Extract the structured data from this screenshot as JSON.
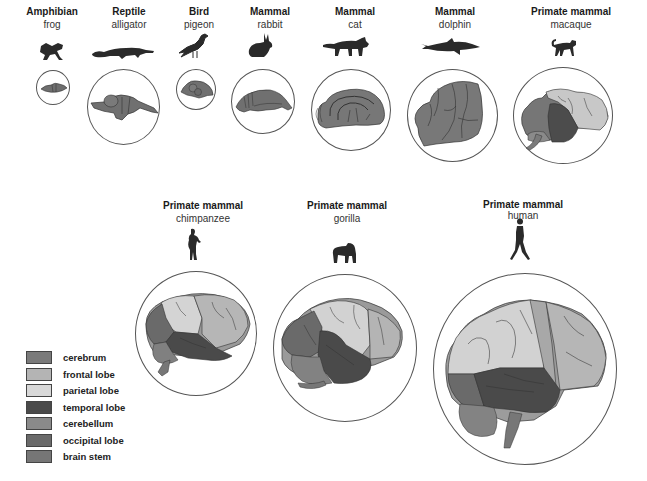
{
  "figure": {
    "animals": [
      {
        "class": "Amphibian",
        "species": "frog"
      },
      {
        "class": "Reptile",
        "species": "alligator"
      },
      {
        "class": "Bird",
        "species": "pigeon"
      },
      {
        "class": "Mammal",
        "species": "rabbit"
      },
      {
        "class": "Mammal",
        "species": "cat"
      },
      {
        "class": "Mammal",
        "species": "dolphin"
      },
      {
        "class": "Primate mammal",
        "species": "macaque"
      },
      {
        "class": "Primate mammal",
        "species": "chimpanzee"
      },
      {
        "class": "Primate mammal",
        "species": "gorilla"
      },
      {
        "class": "Primate mammal",
        "species": "human"
      }
    ]
  },
  "legend": {
    "items": [
      {
        "label": "cerebrum",
        "color": "#7a7a7a"
      },
      {
        "label": "frontal lobe",
        "color": "#b4b4b4"
      },
      {
        "label": "parietal lobe",
        "color": "#d8d8d8"
      },
      {
        "label": "temporal lobe",
        "color": "#4a4a4a"
      },
      {
        "label": "cerebellum",
        "color": "#8a8a8a"
      },
      {
        "label": "occipital lobe",
        "color": "#6a6a6a"
      },
      {
        "label": "brain stem",
        "color": "#767676"
      }
    ]
  },
  "colors": {
    "outline": "#555555",
    "silhouette": "#2a2a2a",
    "brain_base": "#7c7c7c",
    "frontal": "#b8b8b8",
    "parietal": "#d6d6d6",
    "temporal": "#4c4c4c",
    "occipital": "#666666",
    "cerebellum": "#8a8a8a"
  }
}
